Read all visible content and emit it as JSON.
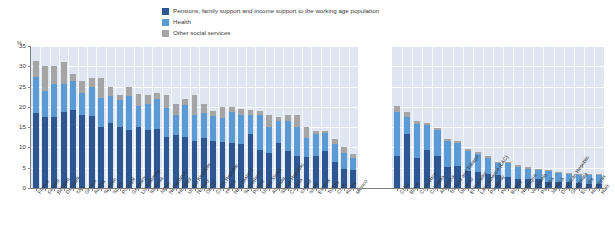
{
  "legend": {
    "items": [
      {
        "label": "Pensions, family support and income support to the working age population",
        "color": "#2d5792",
        "name": "legend-pensions"
      },
      {
        "label": "Health",
        "color": "#5b9bd5",
        "name": "legend-health"
      },
      {
        "label": "Other social services",
        "color": "#a5a5a5",
        "name": "legend-other"
      }
    ]
  },
  "axis": {
    "unit": "%",
    "yticks": [
      "0",
      "5",
      "10",
      "15",
      "20",
      "25",
      "30",
      "35"
    ]
  },
  "chart_data": {
    "type": "bar",
    "title": "",
    "subtitle": "",
    "xlabel": "",
    "ylabel": "%",
    "ylim": [
      0,
      35
    ],
    "stacked": true,
    "grid": true,
    "legend_position": "top-center",
    "series_names": [
      "Pensions, family support and income support to the working age population",
      "Health",
      "Other social services"
    ],
    "series_colors": [
      "#2d5792",
      "#5b9bd5",
      "#a5a5a5"
    ],
    "panels": [
      {
        "name": "oecd",
        "categories": [
          "France",
          "Finland",
          "Belgium",
          "Denmark",
          "Italy",
          "Greece",
          "Austria",
          "Sweden",
          "Spain",
          "Portugal",
          "Germany",
          "Luxembourg",
          "Slovenia",
          "Japan",
          "Netherlands",
          "Hungary",
          "United Kingdom",
          "Norway",
          "OECD",
          "Czech Republic",
          "Ireland",
          "New Zealand",
          "Switzerland",
          "Poland",
          "United States",
          "Australia",
          "Slovak Republic",
          "Canada",
          "Iceland",
          "Israel",
          "Estonia",
          "Turkey",
          "Chile",
          "Korea",
          "Mexico"
        ],
        "series": [
          {
            "name": "Pensions, family support and income support to the working age population",
            "values": [
              18.6,
              17.5,
              17.6,
              18.7,
              19.3,
              17.9,
              17.8,
              15.1,
              16.0,
              15.1,
              14.2,
              15.0,
              14.2,
              14.5,
              12.5,
              13.1,
              12.6,
              11.5,
              12.3,
              11.5,
              11.3,
              11.0,
              10.9,
              13.2,
              9.4,
              8.7,
              11.0,
              9.2,
              8.0,
              7.6,
              8.0,
              9.2,
              6.4,
              4.6,
              4.5
            ]
          },
          {
            "name": "Health",
            "values": [
              8.7,
              6.5,
              8.0,
              7.0,
              7.0,
              5.6,
              7.1,
              7.1,
              6.7,
              6.5,
              8.6,
              5.1,
              6.5,
              7.4,
              7.3,
              5.0,
              7.8,
              6.5,
              6.3,
              6.2,
              5.9,
              7.7,
              7.0,
              4.9,
              8.5,
              6.4,
              5.6,
              7.4,
              7.0,
              4.7,
              5.2,
              4.3,
              4.4,
              4.0,
              3.0
            ]
          },
          {
            "name": "Other social services",
            "values": [
              4.0,
              6.0,
              4.4,
              5.3,
              1.7,
              2.8,
              2.1,
              5.0,
              2.3,
              1.4,
              2.2,
              3.1,
              2.3,
              1.6,
              3.2,
              2.5,
              1.6,
              5.0,
              2.2,
              1.3,
              2.8,
              1.3,
              1.6,
              1.1,
              1.1,
              2.9,
              1.0,
              1.4,
              3.0,
              2.7,
              0.8,
              0.5,
              1.2,
              1.4,
              1.0
            ]
          }
        ]
      },
      {
        "name": "latin-america",
        "categories": [
          "Cuba",
          "Brazil",
          "Costa Rica",
          "Colombia",
          "Argentina",
          "Trinidad and Tobago",
          "Uruguay",
          "El Salvador",
          "Latin America (LAC)",
          "Paraguay",
          "Peru",
          "Bolivia",
          "Nicaragua",
          "Venezuela",
          "Panama",
          "Jamaica",
          "Dominican Republic",
          "Guatemala",
          "Ecuador",
          "Honduras",
          "Haiti"
        ],
        "series": [
          {
            "name": "Pensions, family support and income support to the working age population",
            "values": [
              8.0,
              13.2,
              7.4,
              9.3,
              8.0,
              5.3,
              5.4,
              4.1,
              4.0,
              3.5,
              3.2,
              2.7,
              2.3,
              2.3,
              2.1,
              1.6,
              1.5,
              1.4,
              1.2,
              1.1,
              0.9
            ]
          },
          {
            "name": "Health",
            "values": [
              10.8,
              4.2,
              8.4,
              6.2,
              6.2,
              6.2,
              5.6,
              5.0,
              4.4,
              4.0,
              3.0,
              3.4,
              3.0,
              2.5,
              2.4,
              2.6,
              2.2,
              2.0,
              2.0,
              2.0,
              2.2
            ]
          },
          {
            "name": "Other social services",
            "values": [
              1.3,
              1.3,
              0.7,
              0.5,
              0.5,
              0.6,
              0.5,
              0.5,
              0.5,
              0.4,
              0.3,
              0.3,
              0.3,
              0.3,
              0.3,
              0.3,
              0.3,
              0.3,
              0.3,
              0.3,
              0.3
            ]
          }
        ]
      }
    ]
  }
}
